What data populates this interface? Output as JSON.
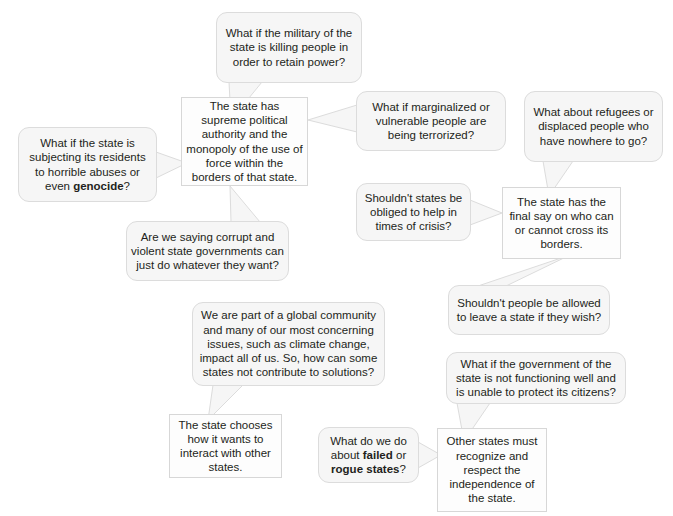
{
  "diagram": {
    "background_color": "#ffffff",
    "box_fill": "#fdfdfd",
    "box_border": "#d7d7d7",
    "bubble_fill": "#f6f6f6",
    "bubble_border": "#dcdcdc",
    "text_color": "#231f20",
    "boxes": [
      {
        "id": "state-supreme-authority",
        "text": "The state has supreme political authority and the monopoly of the use of force within the borders of that state."
      },
      {
        "id": "state-borders",
        "text": "The state has the final say on who can or cannot cross its borders."
      },
      {
        "id": "state-interacts",
        "text": "The state chooses how it wants to interact with other states."
      },
      {
        "id": "state-recognition",
        "text": "Other states must recognize and respect the independence of the state."
      }
    ],
    "bubbles": [
      {
        "id": "military-killing",
        "text": "What if the military of the state is killing people in order to retain power?"
      },
      {
        "id": "marginalized-terrorized",
        "text": "What if marginalized or vulnerable people are being terrorized?"
      },
      {
        "id": "refugees-displaced",
        "text": "What about refugees or displaced people who have nowhere to go?"
      },
      {
        "id": "horrible-abuses-genocide",
        "text_before": "What if the state is subjecting its residents to horrible abuses or even ",
        "text_bold": "genocide",
        "text_after": "?"
      },
      {
        "id": "corrupt-violent-governments",
        "text": "Are we saying corrupt and violent state governments can just do whatever they want?"
      },
      {
        "id": "obliged-help-crisis",
        "text": "Shouldn't states be obliged to help in times of crisis?"
      },
      {
        "id": "allowed-to-leave",
        "text": "Shouldn't people be allowed to leave a state if they wish?"
      },
      {
        "id": "global-community",
        "text": "We are part of a global community and many of our most concerning issues, such as climate change, impact all of us. So, how can some states not contribute to solutions?"
      },
      {
        "id": "government-not-functioning",
        "text": "What if the government of the state is not functioning well and is unable to protect its citizens?"
      },
      {
        "id": "failed-rogue-states",
        "text_before": "What do we do about ",
        "text_bold": "failed",
        "text_mid": " or ",
        "text_bold2": "rogue states",
        "text_after": "?"
      }
    ]
  }
}
